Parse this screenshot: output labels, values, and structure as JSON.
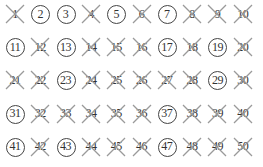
{
  "layout": {
    "columns": 10,
    "rows": 5,
    "x0": 15,
    "dx": 25.3,
    "y0": 14,
    "dy": 33.2
  },
  "colors": {
    "cross": "#9a9a9a",
    "ring": "#444444",
    "text": "#333333"
  },
  "numbers": [
    {
      "n": "1",
      "state": "crossed"
    },
    {
      "n": "2",
      "state": "prime"
    },
    {
      "n": "3",
      "state": "prime"
    },
    {
      "n": "4",
      "state": "crossed"
    },
    {
      "n": "5",
      "state": "prime"
    },
    {
      "n": "6",
      "state": "crossed"
    },
    {
      "n": "7",
      "state": "prime"
    },
    {
      "n": "8",
      "state": "crossed"
    },
    {
      "n": "9",
      "state": "crossed"
    },
    {
      "n": "10",
      "state": "crossed"
    },
    {
      "n": "11",
      "state": "prime"
    },
    {
      "n": "12",
      "state": "crossed"
    },
    {
      "n": "13",
      "state": "prime"
    },
    {
      "n": "14",
      "state": "crossed"
    },
    {
      "n": "15",
      "state": "crossed"
    },
    {
      "n": "16",
      "state": "crossed"
    },
    {
      "n": "17",
      "state": "prime"
    },
    {
      "n": "18",
      "state": "crossed"
    },
    {
      "n": "19",
      "state": "prime"
    },
    {
      "n": "20",
      "state": "crossed"
    },
    {
      "n": "21",
      "state": "crossed"
    },
    {
      "n": "22",
      "state": "crossed"
    },
    {
      "n": "23",
      "state": "prime"
    },
    {
      "n": "24",
      "state": "crossed"
    },
    {
      "n": "25",
      "state": "crossed"
    },
    {
      "n": "26",
      "state": "crossed"
    },
    {
      "n": "27",
      "state": "crossed"
    },
    {
      "n": "28",
      "state": "crossed"
    },
    {
      "n": "29",
      "state": "prime"
    },
    {
      "n": "30",
      "state": "crossed"
    },
    {
      "n": "31",
      "state": "prime"
    },
    {
      "n": "32",
      "state": "crossed"
    },
    {
      "n": "33",
      "state": "crossed"
    },
    {
      "n": "34",
      "state": "crossed"
    },
    {
      "n": "35",
      "state": "crossed"
    },
    {
      "n": "36",
      "state": "crossed"
    },
    {
      "n": "37",
      "state": "prime"
    },
    {
      "n": "38",
      "state": "crossed"
    },
    {
      "n": "39",
      "state": "crossed"
    },
    {
      "n": "40",
      "state": "crossed"
    },
    {
      "n": "41",
      "state": "prime"
    },
    {
      "n": "42",
      "state": "crossed"
    },
    {
      "n": "43",
      "state": "prime"
    },
    {
      "n": "44",
      "state": "crossed"
    },
    {
      "n": "45",
      "state": "crossed"
    },
    {
      "n": "46",
      "state": "crossed"
    },
    {
      "n": "47",
      "state": "prime"
    },
    {
      "n": "48",
      "state": "crossed"
    },
    {
      "n": "49",
      "state": "crossed"
    },
    {
      "n": "50",
      "state": "crossed"
    }
  ]
}
